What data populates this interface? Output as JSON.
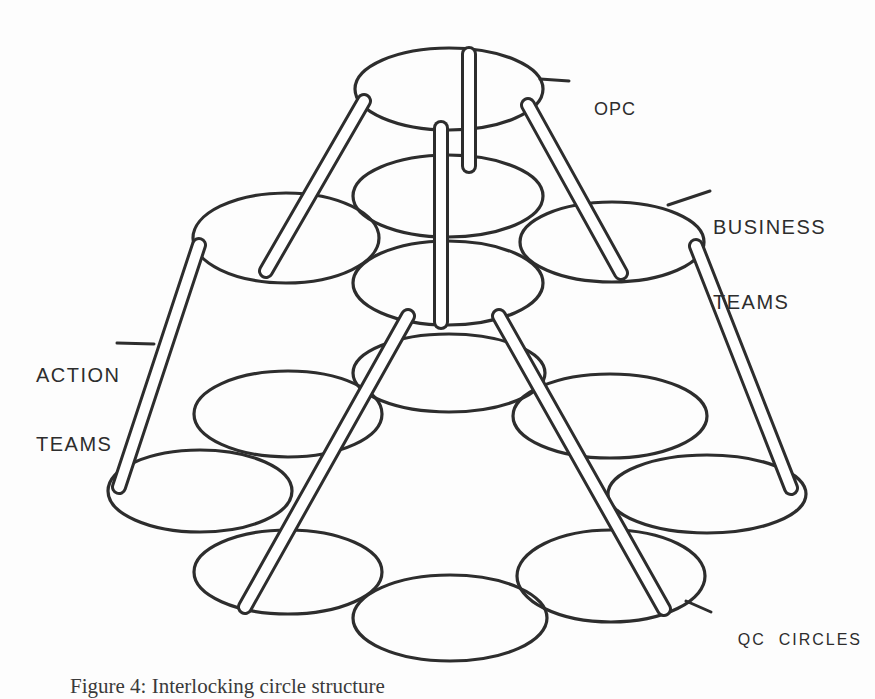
{
  "figure": {
    "caption": "Figure 4: Interlocking circle structure",
    "labels": {
      "opc": "OPC",
      "business": {
        "line1": "BUSINESS",
        "line2": "TEAMS"
      },
      "action": {
        "line1": "ACTION",
        "line2": "TEAMS"
      },
      "qc": "QC  CIRCLES"
    }
  },
  "colors": {
    "ink": "#2d2d2d",
    "paper": "#fdfdfd",
    "rod_fill": "#ffffff"
  },
  "diagram": {
    "type": "tiered-linked-circles",
    "ellipses": [
      {
        "name": "opc",
        "cx": 449,
        "cy": 89,
        "rx": 94,
        "ry": 41
      },
      {
        "name": "business-center",
        "cx": 448,
        "cy": 196,
        "rx": 95,
        "ry": 41
      },
      {
        "name": "business-left",
        "cx": 286,
        "cy": 238,
        "rx": 93,
        "ry": 45
      },
      {
        "name": "business-right",
        "cx": 612,
        "cy": 242,
        "rx": 92,
        "ry": 40
      },
      {
        "name": "action-hub",
        "cx": 448,
        "cy": 283,
        "rx": 95,
        "ry": 42
      },
      {
        "name": "qc-top-center",
        "cx": 449,
        "cy": 373,
        "rx": 96,
        "ry": 39
      },
      {
        "name": "qc-upper-left",
        "cx": 288,
        "cy": 414,
        "rx": 94,
        "ry": 43
      },
      {
        "name": "qc-upper-right",
        "cx": 610,
        "cy": 416,
        "rx": 97,
        "ry": 42
      },
      {
        "name": "qc-far-left",
        "cx": 200,
        "cy": 491,
        "rx": 92,
        "ry": 41
      },
      {
        "name": "qc-far-right",
        "cx": 707,
        "cy": 494,
        "rx": 99,
        "ry": 39
      },
      {
        "name": "qc-bottom-left",
        "cx": 288,
        "cy": 572,
        "rx": 94,
        "ry": 42
      },
      {
        "name": "qc-bottom-center",
        "cx": 450,
        "cy": 618,
        "rx": 97,
        "ry": 43
      },
      {
        "name": "qc-bottom-right",
        "cx": 611,
        "cy": 576,
        "rx": 94,
        "ry": 46
      }
    ],
    "rods": [
      {
        "name": "opc-center-upper",
        "x1": 469,
        "y1": 54,
        "x2": 469,
        "y2": 166
      },
      {
        "name": "opc-center-lower",
        "x1": 441,
        "y1": 128,
        "x2": 441,
        "y2": 322
      },
      {
        "name": "opc-to-left-team",
        "x1": 364,
        "y1": 101,
        "x2": 266,
        "y2": 271
      },
      {
        "name": "opc-to-right-team",
        "x1": 528,
        "y1": 105,
        "x2": 621,
        "y2": 273
      },
      {
        "name": "action-outer-left",
        "x1": 199,
        "y1": 245,
        "x2": 119,
        "y2": 487
      },
      {
        "name": "action-outer-right",
        "x1": 696,
        "y1": 246,
        "x2": 791,
        "y2": 488
      },
      {
        "name": "action-inner-left",
        "x1": 408,
        "y1": 316,
        "x2": 245,
        "y2": 607
      },
      {
        "name": "action-inner-right",
        "x1": 499,
        "y1": 316,
        "x2": 664,
        "y2": 609
      }
    ],
    "pointers": [
      {
        "name": "opc",
        "x1": 540,
        "y1": 79,
        "x2": 569,
        "y2": 81
      },
      {
        "name": "business",
        "x1": 668,
        "y1": 205,
        "x2": 710,
        "y2": 191
      },
      {
        "name": "action",
        "x1": 117,
        "y1": 343,
        "x2": 154,
        "y2": 344
      },
      {
        "name": "qc",
        "x1": 686,
        "y1": 601,
        "x2": 711,
        "y2": 612
      }
    ]
  }
}
